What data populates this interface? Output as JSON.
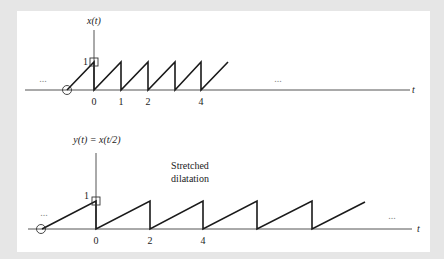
{
  "diagram": {
    "top_plot": {
      "y_label": "x(t)",
      "x_label": "t",
      "amplitude_label": "1",
      "ticks": [
        {
          "label": "0",
          "x": 94
        },
        {
          "label": "1",
          "x": 121
        },
        {
          "label": "2",
          "x": 148
        },
        {
          "label": "4",
          "x": 201
        }
      ],
      "left_ellipsis": "...",
      "right_ellipsis": "..."
    },
    "bottom_plot": {
      "y_label": "y(t) = x(t/2)",
      "x_label": "t",
      "amplitude_label": "1",
      "annotation_line1": "Stretched",
      "annotation_line2": "dilatation",
      "ticks": [
        {
          "label": "0",
          "x": 96
        },
        {
          "label": "2",
          "x": 150
        },
        {
          "label": "4",
          "x": 203
        }
      ],
      "left_ellipsis": "...",
      "right_ellipsis": "..."
    },
    "colors": {
      "background": "#e6e6e6",
      "panel": "#ffffff",
      "signal": "#1a1a1a",
      "axis": "#555555"
    }
  }
}
